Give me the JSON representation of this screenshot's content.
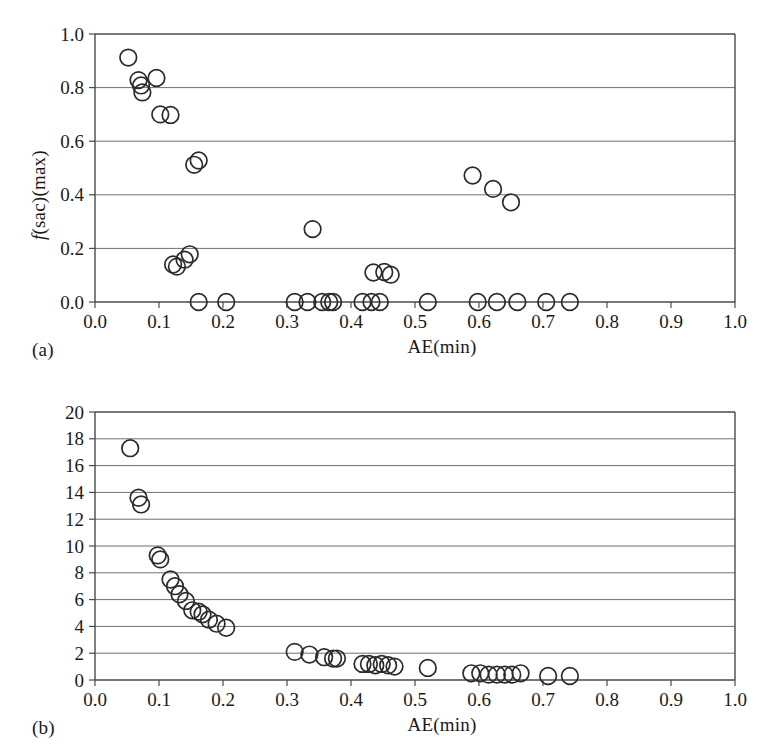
{
  "figure": {
    "panels": [
      {
        "id": "a",
        "label": "(a)",
        "xlabel": "AE(min)",
        "ylabel_italic": "f",
        "ylabel_rest": "(sac)(max)"
      },
      {
        "id": "b",
        "label": "(b)",
        "xlabel": "AE(min)",
        "ylabel_italic": "E",
        "ylabel_rest": "(max)"
      }
    ],
    "colors": {
      "marker_stroke": "#2b2b2b",
      "gridline": "#6f6f6f",
      "axis": "#4a4a4a",
      "background": "#ffffff",
      "text": "#1a1a1a"
    }
  },
  "chart_data": [
    {
      "type": "scatter",
      "panel": "a",
      "title": "",
      "xlabel": "AE(min)",
      "ylabel": "f(sac)(max)",
      "xlim": [
        0.0,
        1.0
      ],
      "ylim": [
        0.0,
        1.0
      ],
      "xticks": [
        "0.0",
        "0.1",
        "0.2",
        "0.3",
        "0.4",
        "0.5",
        "0.6",
        "0.7",
        "0.8",
        "0.9",
        "1.0"
      ],
      "xtick_values": [
        0.0,
        0.1,
        0.2,
        0.3,
        0.4,
        0.5,
        0.6,
        0.7,
        0.8,
        0.9,
        1.0
      ],
      "yticks": [
        "0.0",
        "0.2",
        "0.4",
        "0.6",
        "0.8",
        "1.0"
      ],
      "ytick_values": [
        0.0,
        0.2,
        0.4,
        0.6,
        0.8,
        1.0
      ],
      "grid": true,
      "legend": "none",
      "marker": "open-circle",
      "x": [
        0.052,
        0.068,
        0.072,
        0.074,
        0.096,
        0.102,
        0.118,
        0.122,
        0.128,
        0.14,
        0.155,
        0.162,
        0.205,
        0.148,
        0.162,
        0.312,
        0.332,
        0.355,
        0.366,
        0.372,
        0.418,
        0.432,
        0.445,
        0.435,
        0.452,
        0.462,
        0.34,
        0.52,
        0.59,
        0.622,
        0.65,
        0.598,
        0.628,
        0.66,
        0.705,
        0.742
      ],
      "y": [
        0.912,
        0.828,
        0.808,
        0.782,
        0.836,
        0.7,
        0.698,
        0.14,
        0.132,
        0.158,
        0.512,
        0.528,
        0.0,
        0.178,
        0.0,
        0.0,
        0.0,
        0.0,
        0.0,
        0.0,
        0.0,
        0.0,
        0.0,
        0.11,
        0.112,
        0.102,
        0.272,
        0.0,
        0.472,
        0.422,
        0.372,
        0.0,
        0.0,
        0.0,
        0.0,
        0.0
      ]
    },
    {
      "type": "scatter",
      "panel": "b",
      "title": "",
      "xlabel": "AE(min)",
      "ylabel": "E(max)",
      "xlim": [
        0.0,
        1.0
      ],
      "ylim": [
        0,
        20
      ],
      "xticks": [
        "0.0",
        "0.1",
        "0.2",
        "0.3",
        "0.4",
        "0.5",
        "0.6",
        "0.7",
        "0.8",
        "0.9",
        "1.0"
      ],
      "xtick_values": [
        0.0,
        0.1,
        0.2,
        0.3,
        0.4,
        0.5,
        0.6,
        0.7,
        0.8,
        0.9,
        1.0
      ],
      "yticks": [
        "0",
        "2",
        "4",
        "6",
        "8",
        "10",
        "12",
        "14",
        "16",
        "18",
        "20"
      ],
      "ytick_values": [
        0,
        2,
        4,
        6,
        8,
        10,
        12,
        14,
        16,
        18,
        20
      ],
      "grid": true,
      "legend": "none",
      "marker": "open-circle",
      "x": [
        0.055,
        0.068,
        0.072,
        0.098,
        0.102,
        0.118,
        0.125,
        0.132,
        0.142,
        0.152,
        0.162,
        0.168,
        0.178,
        0.19,
        0.205,
        0.312,
        0.335,
        0.358,
        0.372,
        0.378,
        0.418,
        0.428,
        0.438,
        0.448,
        0.458,
        0.468,
        0.52,
        0.588,
        0.602,
        0.615,
        0.628,
        0.64,
        0.652,
        0.665,
        0.708,
        0.742
      ],
      "y": [
        17.3,
        13.6,
        13.1,
        9.3,
        9.0,
        7.5,
        7.0,
        6.4,
        5.9,
        5.2,
        5.1,
        4.9,
        4.5,
        4.2,
        3.9,
        2.1,
        1.9,
        1.7,
        1.6,
        1.6,
        1.2,
        1.2,
        1.1,
        1.2,
        1.1,
        1.0,
        0.9,
        0.5,
        0.5,
        0.4,
        0.4,
        0.4,
        0.4,
        0.5,
        0.3,
        0.3
      ]
    }
  ]
}
